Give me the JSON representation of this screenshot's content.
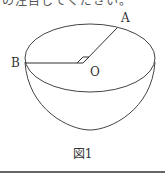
{
  "top_text": "の注目してください。",
  "diagram": {
    "labels": {
      "A": "A",
      "B": "B",
      "O": "O"
    },
    "stroke_color": "#333333"
  },
  "caption": "図1"
}
